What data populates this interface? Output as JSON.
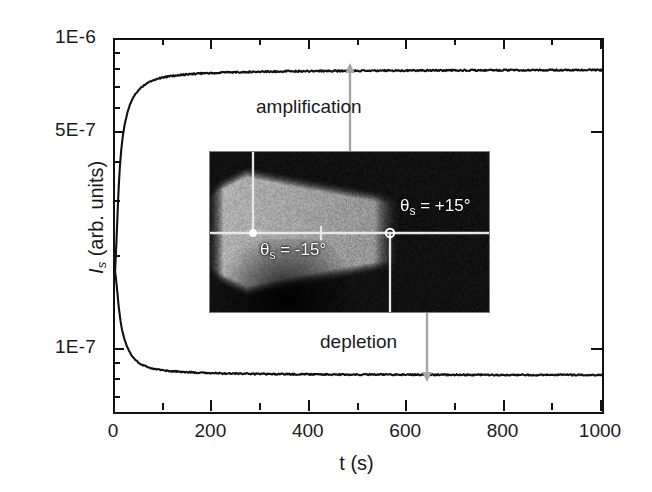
{
  "figure": {
    "background_color": "#ffffff",
    "foreground_color": "#1a1a1a",
    "overlay_color": "#a6a6a6"
  },
  "axes": {
    "x_title": "t (s)",
    "y_title_italic": "I",
    "y_title_sub": "s",
    "y_title_rest": " (arb. units)",
    "x_tick_labels": [
      "0",
      "200",
      "400",
      "600",
      "800",
      "1000"
    ],
    "y_tick_labels": [
      "1E-6",
      "5E-7",
      "1E-7"
    ]
  },
  "annotations": {
    "amplification": "amplification",
    "depletion": "depletion"
  },
  "inset": {
    "label_left_theta": "θ",
    "label_left_sub": "s",
    "label_left_value": " = -15°",
    "label_right_theta": "θ",
    "label_right_sub": "s",
    "label_right_value": " = +15°"
  },
  "chart_data": {
    "type": "line",
    "title": "",
    "xlabel": "t (s)",
    "ylabel": "I_s (arb. units)",
    "xlim": [
      0,
      1000
    ],
    "ylim": [
      6.3e-08,
      1e-06
    ],
    "yscale": "log",
    "xscale": "linear",
    "grid": false,
    "legend": false,
    "x_ticks_major": [
      0,
      200,
      400,
      600,
      800,
      1000
    ],
    "x_ticks_minor": [
      100,
      300,
      500,
      700,
      900
    ],
    "y_ticks_labeled": [
      1e-06,
      5e-07,
      1e-07
    ],
    "y_ticks_minor": [
      9e-07,
      8e-07,
      7e-07,
      6e-07,
      4e-07,
      3e-07,
      2e-07,
      9e-08,
      8e-08,
      7e-08
    ],
    "annotations": [
      {
        "text": "amplification",
        "x": 420,
        "y": 6.2e-07,
        "arrow": "up",
        "arrow_x": 348,
        "arrow_from_y": 2.6e-07,
        "arrow_to_y": 7.6e-07
      },
      {
        "text": "depletion",
        "x": 415,
        "y": 1.05e-07,
        "arrow": "down",
        "arrow_x": 640,
        "arrow_from_y": 2.6e-07,
        "arrow_to_y": 8.8e-08
      }
    ],
    "series": [
      {
        "name": "amplification",
        "comment": "rises from ~1.8e-7 at t=0 to a plateau near 8e-7",
        "x": [
          0,
          2,
          4,
          6,
          8,
          10,
          13,
          16,
          20,
          25,
          30,
          36,
          42,
          50,
          60,
          70,
          80,
          95,
          110,
          130,
          150,
          175,
          200,
          230,
          260,
          300,
          340,
          380,
          420,
          470,
          520,
          570,
          620,
          670,
          720,
          780,
          840,
          900,
          950,
          1000
        ],
        "y": [
          1.78e-07,
          2.05e-07,
          2.45e-07,
          2.95e-07,
          3.45e-07,
          3.9e-07,
          4.45e-07,
          4.9e-07,
          5.35e-07,
          5.8e-07,
          6.15e-07,
          6.45e-07,
          6.7e-07,
          6.95e-07,
          7.15e-07,
          7.3e-07,
          7.42e-07,
          7.55e-07,
          7.63e-07,
          7.7e-07,
          7.75e-07,
          7.8e-07,
          7.83e-07,
          7.86e-07,
          7.88e-07,
          7.9e-07,
          7.92e-07,
          7.93e-07,
          7.94e-07,
          7.95e-07,
          7.96e-07,
          7.97e-07,
          7.97e-07,
          7.98e-07,
          7.98e-07,
          7.99e-07,
          7.99e-07,
          8e-07,
          8e-07,
          8e-07
        ]
      },
      {
        "name": "depletion",
        "comment": "falls from ~1.8e-7 at t=0 to a plateau near 8.3e-8",
        "x": [
          0,
          2,
          4,
          6,
          8,
          11,
          14,
          18,
          22,
          27,
          33,
          40,
          48,
          57,
          68,
          80,
          95,
          112,
          130,
          155,
          180,
          210,
          245,
          285,
          330,
          380,
          430,
          490,
          550,
          610,
          670,
          730,
          790,
          850,
          910,
          960,
          1000
        ],
        "y": [
          1.8e-07,
          1.7e-07,
          1.58e-07,
          1.46e-07,
          1.36e-07,
          1.25e-07,
          1.17e-07,
          1.1e-07,
          1.05e-07,
          1.005e-07,
          9.65e-08,
          9.35e-08,
          9.1e-08,
          8.92e-08,
          8.78e-08,
          8.68e-08,
          8.6e-08,
          8.54e-08,
          8.5e-08,
          8.46e-08,
          8.43e-08,
          8.4e-08,
          8.38e-08,
          8.36e-08,
          8.35e-08,
          8.34e-08,
          8.33e-08,
          8.32e-08,
          8.32e-08,
          8.31e-08,
          8.31e-08,
          8.3e-08,
          8.3e-08,
          8.3e-08,
          8.3e-08,
          8.3e-08,
          8.3e-08
        ]
      }
    ]
  }
}
